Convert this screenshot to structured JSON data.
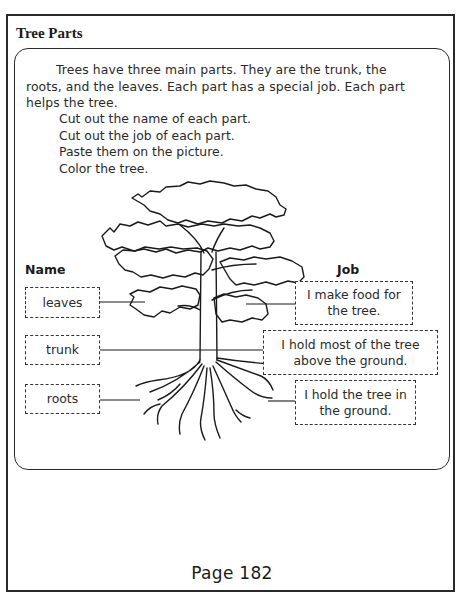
{
  "worksheet": {
    "title": "Tree Parts",
    "intro": "Trees have three main parts. They are the trunk, the roots, and the leaves. Each part has a special job. Each part helps the tree.",
    "steps": [
      "Cut out the name of each part.",
      "Cut out the job of each part.",
      "Paste them on the picture.",
      "Color the tree."
    ],
    "name_column": {
      "label": "Name",
      "items": [
        "leaves",
        "trunk",
        "roots"
      ]
    },
    "job_column": {
      "label": "Job",
      "items": [
        "I make food for the tree.",
        "I hold most of the tree above the ground.",
        "I hold the tree in the ground."
      ]
    },
    "illustration": "tree-with-leaves-trunk-roots",
    "page_number": "Page 182"
  }
}
